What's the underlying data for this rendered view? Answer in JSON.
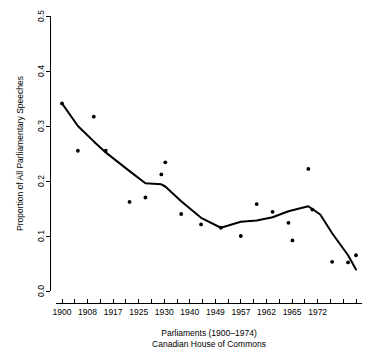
{
  "chart_data": {
    "type": "scatter",
    "title": "",
    "subtitle": "",
    "xlabel": "Parliaments (1900-1974)",
    "xlabel_line2": "Canadian House of Commons",
    "ylabel": "Proportion of All Parliamentary Speeches",
    "xlim": [
      1900,
      1974
    ],
    "ylim": [
      0.0,
      0.5
    ],
    "grid": false,
    "legend": "none",
    "x_tick_labels": [
      "1900",
      "1908",
      "1917",
      "1925",
      "1930",
      "1940",
      "1949",
      "1957",
      "1962",
      "1965",
      "1972"
    ],
    "x_tick_values": [
      1900,
      1908,
      1917,
      1925,
      1930,
      1940,
      1949,
      1957,
      1962,
      1965,
      1972
    ],
    "x_minor_tick_count": 24,
    "y_tick_labels": [
      "0.0",
      "0.1",
      "0.2",
      "0.3",
      "0.4",
      "0.5"
    ],
    "y_tick_values": [
      0.0,
      0.1,
      0.2,
      0.3,
      0.4,
      0.5
    ],
    "point_color": "#000000",
    "line_color": "#000000",
    "points": [
      {
        "x": 1900,
        "y": 0.341
      },
      {
        "x": 1904,
        "y": 0.255
      },
      {
        "x": 1908,
        "y": 0.317
      },
      {
        "x": 1911,
        "y": 0.255
      },
      {
        "x": 1917,
        "y": 0.162
      },
      {
        "x": 1921,
        "y": 0.17
      },
      {
        "x": 1925,
        "y": 0.212
      },
      {
        "x": 1926,
        "y": 0.234
      },
      {
        "x": 1930,
        "y": 0.14
      },
      {
        "x": 1935,
        "y": 0.121
      },
      {
        "x": 1940,
        "y": 0.115
      },
      {
        "x": 1945,
        "y": 0.1
      },
      {
        "x": 1949,
        "y": 0.158
      },
      {
        "x": 1953,
        "y": 0.144
      },
      {
        "x": 1957,
        "y": 0.124
      },
      {
        "x": 1958,
        "y": 0.092
      },
      {
        "x": 1962,
        "y": 0.222
      },
      {
        "x": 1963,
        "y": 0.148
      },
      {
        "x": 1968,
        "y": 0.053
      },
      {
        "x": 1972,
        "y": 0.052
      },
      {
        "x": 1974,
        "y": 0.065
      }
    ],
    "trend_line": [
      {
        "x": 1900,
        "y": 0.341
      },
      {
        "x": 1904,
        "y": 0.3
      },
      {
        "x": 1908,
        "y": 0.272
      },
      {
        "x": 1911,
        "y": 0.252
      },
      {
        "x": 1917,
        "y": 0.218
      },
      {
        "x": 1921,
        "y": 0.196
      },
      {
        "x": 1925,
        "y": 0.194
      },
      {
        "x": 1926,
        "y": 0.19
      },
      {
        "x": 1930,
        "y": 0.163
      },
      {
        "x": 1935,
        "y": 0.133
      },
      {
        "x": 1940,
        "y": 0.115
      },
      {
        "x": 1945,
        "y": 0.126
      },
      {
        "x": 1949,
        "y": 0.128
      },
      {
        "x": 1953,
        "y": 0.134
      },
      {
        "x": 1957,
        "y": 0.145
      },
      {
        "x": 1962,
        "y": 0.154
      },
      {
        "x": 1965,
        "y": 0.139
      },
      {
        "x": 1968,
        "y": 0.105
      },
      {
        "x": 1972,
        "y": 0.065
      },
      {
        "x": 1974,
        "y": 0.039
      }
    ]
  }
}
